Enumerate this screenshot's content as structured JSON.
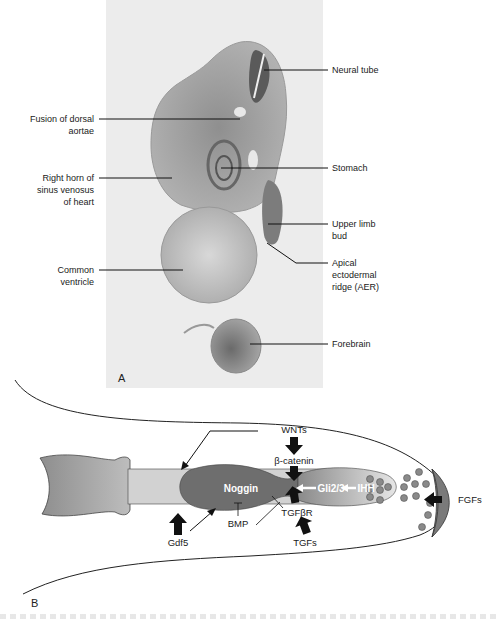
{
  "panel_a": {
    "letter": "A",
    "labels_left": [
      {
        "id": "fusion",
        "lines": [
          "Fusion of dorsal",
          "aortae"
        ]
      },
      {
        "id": "right-horn",
        "lines": [
          "Right horn of",
          "sinus venosus",
          "of heart"
        ]
      },
      {
        "id": "common-ventricle",
        "lines": [
          "Common",
          "ventricle"
        ]
      }
    ],
    "labels_right": [
      {
        "id": "neural-tube",
        "lines": [
          "Neural tube"
        ]
      },
      {
        "id": "stomach",
        "lines": [
          "Stomach"
        ]
      },
      {
        "id": "upper-limb-bud",
        "lines": [
          "Upper limb",
          "bud"
        ]
      },
      {
        "id": "aer",
        "lines": [
          "Apical",
          "ectodermal",
          "ridge (AER)"
        ]
      },
      {
        "id": "forebrain",
        "lines": [
          "Forebrain"
        ]
      }
    ]
  },
  "panel_b": {
    "letter": "B",
    "labels": {
      "wnts": "WNTs",
      "beta_catenin": "β-catenin",
      "noggin": "Noggin",
      "gli": "Gli2/3",
      "ihh": "IHH",
      "bmp": "BMP",
      "tgfbr": "TGFβR",
      "tgfs": "TGFs",
      "gdf5": "Gdf5",
      "fgfs": "FGFs"
    },
    "colors": {
      "bone": "#9a9a9a",
      "shaft": "#d2d2d2",
      "noggin_region": "#6e6e6e",
      "distal_region": "#b8b8b8",
      "dots": "#8a8a8a",
      "aer": "#7a7a7a",
      "outline": "#333333"
    }
  }
}
